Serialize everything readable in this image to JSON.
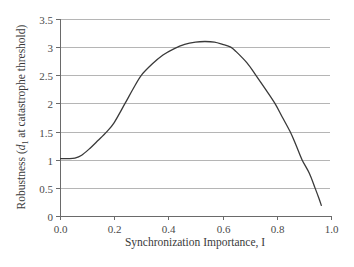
{
  "chart_data": {
    "type": "line",
    "title": "",
    "xlabel": "Synchronization Importance, I",
    "ylabel": "Robustness (d1 at catastrophe threshold)",
    "ylabel_parts": {
      "prefix": "Robustness (",
      "var": "d",
      "sub": "1",
      "suffix": " at catastrophe threshold)"
    },
    "xlim": [
      0.0,
      1.0
    ],
    "ylim": [
      0,
      3.5
    ],
    "x_ticks": [
      "0.0",
      "0.2",
      "0.4",
      "0.6",
      "0.8",
      "1.0"
    ],
    "x_tick_values": [
      0.0,
      0.2,
      0.4,
      0.6,
      0.8,
      1.0
    ],
    "y_ticks": [
      "0",
      "0.5",
      "1",
      "1.5",
      "2",
      "2.5",
      "3",
      "3.5"
    ],
    "y_tick_values": [
      0,
      0.5,
      1,
      1.5,
      2,
      2.5,
      3,
      3.5
    ],
    "grid": {
      "horizontal": true,
      "vertical": false
    },
    "legend": null,
    "series": [
      {
        "name": "Robustness",
        "color": "#3a3a3a",
        "x": [
          0.0,
          0.03,
          0.055,
          0.08,
          0.11,
          0.14,
          0.173,
          0.2,
          0.24,
          0.27,
          0.3,
          0.34,
          0.38,
          0.42,
          0.46,
          0.5,
          0.535,
          0.57,
          0.6,
          0.63,
          0.65,
          0.69,
          0.723,
          0.76,
          0.793,
          0.82,
          0.849,
          0.87,
          0.893,
          0.92,
          0.941,
          0.955,
          0.965
        ],
        "values": [
          1.02,
          1.02,
          1.03,
          1.08,
          1.2,
          1.34,
          1.5,
          1.66,
          2.0,
          2.26,
          2.5,
          2.7,
          2.86,
          2.97,
          3.05,
          3.09,
          3.1,
          3.09,
          3.05,
          3.0,
          2.92,
          2.72,
          2.5,
          2.24,
          2.0,
          1.76,
          1.5,
          1.27,
          1.0,
          0.76,
          0.5,
          0.32,
          0.18
        ]
      }
    ]
  }
}
